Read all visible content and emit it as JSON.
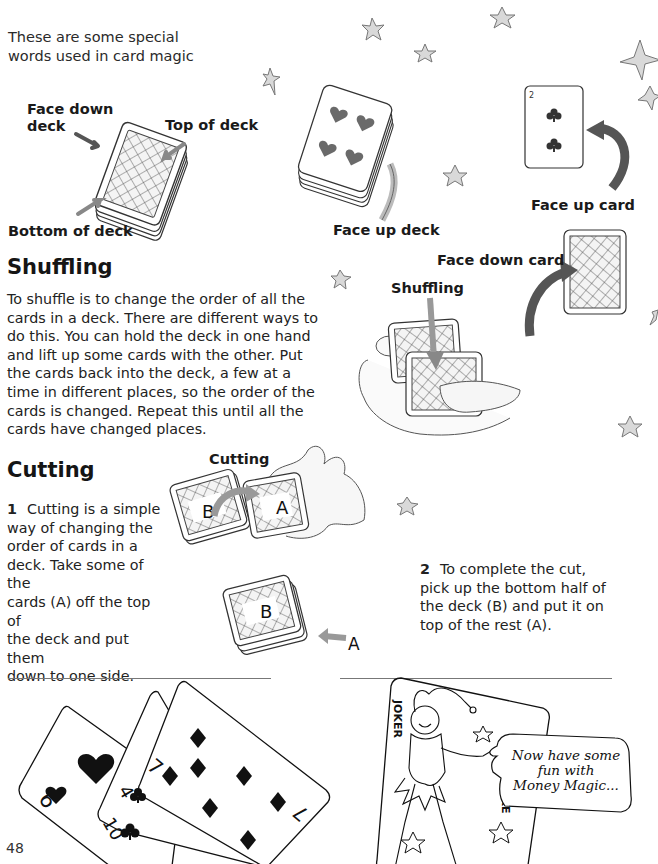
{
  "intro": {
    "line1": "These are some special",
    "line2": "words used in card magic"
  },
  "labels": {
    "face_down_deck_1": "Face down",
    "face_down_deck_2": "deck",
    "top_of_deck": "Top of deck",
    "bottom_of_deck": "Bottom of deck",
    "face_up_deck": "Face up deck",
    "face_up_card": "Face up card",
    "face_down_card": "Face down card",
    "shuffling_illustration": "Shuffling",
    "cutting_illustration": "Cutting"
  },
  "sections": {
    "shuffling": {
      "heading": "Shuffling",
      "lines": [
        "To shuffle is to change the order of all the",
        "cards in a deck. There are different ways to",
        "do this. You can hold the deck in one hand",
        "and lift up some cards with the other. Put",
        "the cards back into the deck, a few at a",
        "time in different places, so the order of the",
        "cards is changed. Repeat this until all the",
        "cards have changed places."
      ]
    },
    "cutting": {
      "heading": "Cutting",
      "step1": {
        "number": "1",
        "lines": [
          "Cutting is a simple",
          "way of changing the",
          "order of cards in a",
          "deck. Take some of the",
          "cards (A) off the top of",
          "the deck and put them",
          "down to one side."
        ]
      },
      "step2": {
        "number": "2",
        "lines": [
          "To complete the cut,",
          "pick up the bottom half of",
          "the deck (B) and put it on",
          "top of the rest (A)."
        ]
      }
    }
  },
  "illustration_markers": {
    "pile_b": "B",
    "pile_a": "A",
    "arrow_a": "A"
  },
  "cards_fan": {
    "card1": {
      "rank": "6",
      "suit": "hearts"
    },
    "card2": {
      "rank": "4",
      "suit": "clubs",
      "rank2": "10"
    },
    "card3": {
      "rank": "7",
      "suit": "diamonds"
    }
  },
  "joker": {
    "corner_text_top": "JOKER",
    "corner_text_bottom": "JOKE",
    "speech_line1": "Now have some",
    "speech_line2": "fun with",
    "speech_line3": "Money Magic..."
  },
  "face_up_card": {
    "rank": "2",
    "suit": "clubs"
  },
  "page_number": "48",
  "colors": {
    "arrow_gray": "#6e6e6e",
    "arrow_dark": "#555555",
    "star_fill": "#d9d9d9",
    "heart_fill": "#6a6a6a",
    "text": "#1e1e1e"
  }
}
